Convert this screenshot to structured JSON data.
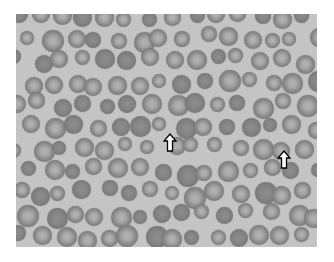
{
  "image": {
    "subject": "blood smear micrograph of red blood cells",
    "background_color": "#c4c4c4",
    "cell_color": "#858585"
  },
  "annotations": [
    {
      "type": "arrow",
      "direction": "up",
      "x": 163,
      "y": 133,
      "fill": "#ffffff",
      "stroke": "#000000"
    },
    {
      "type": "arrow",
      "direction": "up",
      "x": 277,
      "y": 150,
      "fill": "#ffffff",
      "stroke": "#000000"
    }
  ]
}
